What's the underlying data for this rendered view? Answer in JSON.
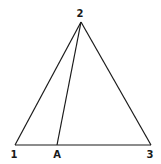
{
  "diagram": {
    "type": "triangle-with-cevian",
    "stroke_color": "#1a1a1a",
    "background": "#ffffff",
    "points": {
      "v1": {
        "label": "1",
        "x": 15,
        "y": 145,
        "label_x": 14,
        "label_y": 158
      },
      "v2": {
        "label": "2",
        "x": 81,
        "y": 22,
        "label_x": 80,
        "label_y": 17
      },
      "v3": {
        "label": "3",
        "x": 151,
        "y": 145,
        "label_x": 150,
        "label_y": 158
      },
      "A": {
        "label": "A",
        "x": 57,
        "y": 145,
        "label_x": 57,
        "label_y": 158
      }
    },
    "segments": [
      {
        "from": "v1",
        "to": "v2"
      },
      {
        "from": "v2",
        "to": "v3"
      },
      {
        "from": "v1",
        "to": "v3"
      },
      {
        "from": "v2",
        "to": "A"
      }
    ]
  }
}
